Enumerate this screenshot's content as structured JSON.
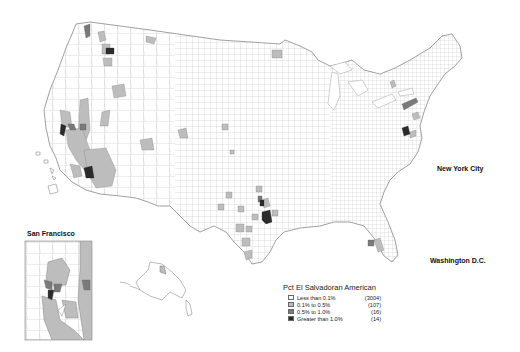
{
  "map": {
    "subject": "Percent El Salvadoran American by U.S. county",
    "colors": {
      "background": "#ffffff",
      "county_border": "#8a8a8a",
      "class_1": "#ffffff",
      "class_2": "#bdbdbd",
      "class_3": "#7a7a7a",
      "class_4": "#2b2b2b"
    }
  },
  "legend": {
    "title": "Pct El Salvadoran American",
    "items": [
      {
        "label": "Less than 0.1%",
        "count": "(3004)",
        "color": "#ffffff"
      },
      {
        "label": "0.1% to 0.5%",
        "count": "(107)",
        "color": "#bdbdbd"
      },
      {
        "label": "0.5% to 1.0%",
        "count": "(16)",
        "color": "#7a7a7a"
      },
      {
        "label": "Greater than 1.0%",
        "count": "(14)",
        "color": "#2b2b2b"
      }
    ]
  },
  "insets": {
    "san_francisco": {
      "title": "San Francisco"
    },
    "new_york_city": {
      "title": "New York City"
    },
    "washington_dc": {
      "title": "Washington D.C."
    }
  }
}
